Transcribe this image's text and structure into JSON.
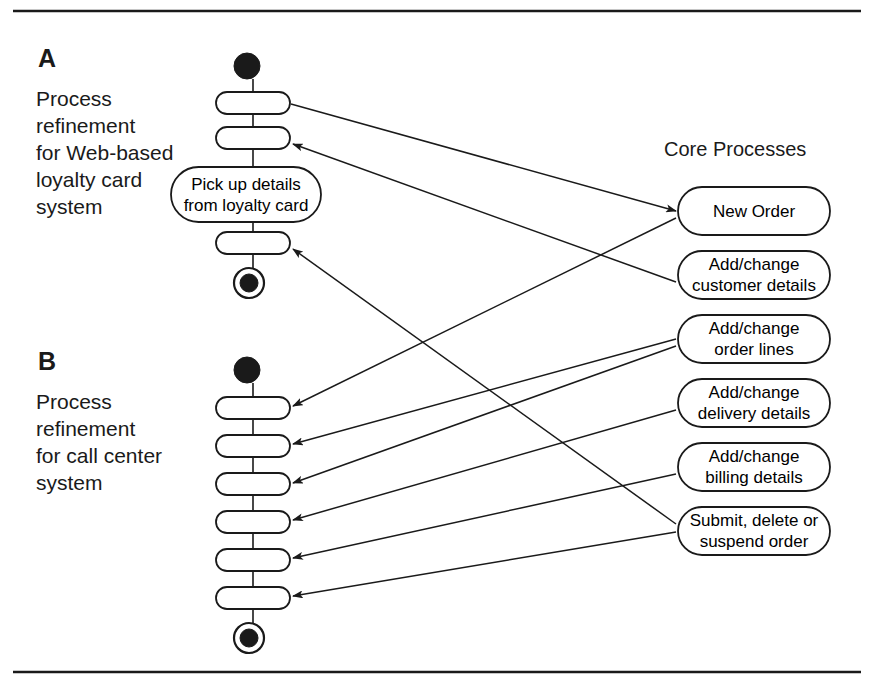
{
  "figure": {
    "top_rule": true,
    "bottom_rule": true,
    "line_color": "#1a1a1a",
    "fill_color": "#ffffff",
    "node_fill": "#ffffff",
    "marker_fill": "#1a1a1a"
  },
  "sections": [
    {
      "letter": "A",
      "description": "Process\nrefinement\nfor Web-based\nloyalty card\nsystem",
      "letter_x": 38,
      "letter_y": 44,
      "desc_x": 36,
      "desc_y": 85,
      "lane_x": 253,
      "start_node": {
        "cx": 247,
        "cy": 66,
        "r": 13
      },
      "end_node": {
        "cx": 249,
        "cy": 283,
        "r": 11,
        "ring_r": 15
      },
      "bars": [
        {
          "id": "a-bar-1",
          "x": 216,
          "y": 92,
          "w": 74,
          "h": 22
        },
        {
          "id": "a-bar-2",
          "x": 216,
          "y": 127,
          "w": 74,
          "h": 22
        },
        {
          "id": "a-bar-3",
          "x": 216,
          "y": 232,
          "w": 74,
          "h": 22
        }
      ],
      "activity": {
        "id": "pick-up-details",
        "label": "Pick up details\nfrom loyalty card",
        "x": 171,
        "y": 167,
        "w": 150,
        "h": 55
      }
    },
    {
      "letter": "B",
      "description": "Process\nrefinement\nfor call center\nsystem",
      "letter_x": 38,
      "letter_y": 347,
      "desc_x": 36,
      "desc_y": 388,
      "lane_x": 253,
      "start_node": {
        "cx": 247,
        "cy": 370,
        "r": 13
      },
      "end_node": {
        "cx": 249,
        "cy": 638,
        "r": 11,
        "ring_r": 15
      },
      "bars": [
        {
          "id": "b-bar-1",
          "x": 216,
          "y": 397,
          "w": 74,
          "h": 22
        },
        {
          "id": "b-bar-2",
          "x": 216,
          "y": 435,
          "w": 74,
          "h": 22
        },
        {
          "id": "b-bar-3",
          "x": 216,
          "y": 473,
          "w": 74,
          "h": 22
        },
        {
          "id": "b-bar-4",
          "x": 216,
          "y": 511,
          "w": 74,
          "h": 22
        },
        {
          "id": "b-bar-5",
          "x": 216,
          "y": 549,
          "w": 74,
          "h": 22
        },
        {
          "id": "b-bar-6",
          "x": 216,
          "y": 587,
          "w": 74,
          "h": 22
        }
      ]
    }
  ],
  "core_processes": {
    "header": "Core Processes",
    "header_x": 664,
    "header_y": 138,
    "box_x": 678,
    "box_w": 152,
    "box_h": 48,
    "items": [
      {
        "id": "new-order",
        "label": "New Order",
        "y": 187
      },
      {
        "id": "add-change-customer-details",
        "label": "Add/change\ncustomer details",
        "y": 251
      },
      {
        "id": "add-change-order-lines",
        "label": "Add/change\norder lines",
        "y": 315
      },
      {
        "id": "add-change-delivery-details",
        "label": "Add/change\ndelivery details",
        "y": 379
      },
      {
        "id": "add-change-billing-details",
        "label": "Add/change\nbilling details",
        "y": 443
      },
      {
        "id": "submit-delete-suspend-order",
        "label": "Submit, delete or\nsuspend order",
        "y": 507
      }
    ]
  },
  "connections": [
    {
      "id": "conn-a1-to-new-order",
      "from": "a-bar-1",
      "to": "new-order",
      "x1": 291,
      "y1": 104,
      "x2": 676,
      "y2": 211,
      "arrow_at": "end"
    },
    {
      "id": "conn-customer-details-to-a2",
      "from": "add-change-customer-details",
      "to": "a-bar-2",
      "x1": 676,
      "y1": 282,
      "x2": 293,
      "y2": 144,
      "arrow_at": "end"
    },
    {
      "id": "conn-submit-to-a3",
      "from": "submit-delete-suspend-order",
      "to": "a-bar-3",
      "x1": 676,
      "y1": 524,
      "x2": 293,
      "y2": 249,
      "arrow_at": "end"
    },
    {
      "id": "conn-new-order-to-b1",
      "from": "new-order",
      "to": "b-bar-1",
      "x1": 676,
      "y1": 218,
      "x2": 293,
      "y2": 406,
      "arrow_at": "end"
    },
    {
      "id": "conn-order-lines-to-b2",
      "from": "add-change-order-lines",
      "to": "b-bar-2",
      "x1": 676,
      "y1": 339,
      "x2": 293,
      "y2": 444,
      "arrow_at": "end"
    },
    {
      "id": "conn-order-lines-to-b3",
      "from": "add-change-order-lines",
      "to": "b-bar-3",
      "x1": 676,
      "y1": 346,
      "x2": 293,
      "y2": 483,
      "arrow_at": "end"
    },
    {
      "id": "conn-delivery-details-to-b4",
      "from": "add-change-delivery-details",
      "to": "b-bar-4",
      "x1": 676,
      "y1": 410,
      "x2": 293,
      "y2": 520,
      "arrow_at": "end"
    },
    {
      "id": "conn-billing-details-to-b5",
      "from": "add-change-billing-details",
      "to": "b-bar-5",
      "x1": 676,
      "y1": 474,
      "x2": 293,
      "y2": 558,
      "arrow_at": "end"
    },
    {
      "id": "conn-submit-to-b6",
      "from": "submit-delete-suspend-order",
      "to": "b-bar-6",
      "x1": 676,
      "y1": 532,
      "x2": 293,
      "y2": 596,
      "arrow_at": "end"
    }
  ],
  "rules": [
    {
      "id": "top-rule",
      "x1": 13,
      "y1": 11,
      "x2": 861,
      "y2": 11
    },
    {
      "id": "bottom-rule",
      "x1": 13,
      "y1": 672,
      "x2": 861,
      "y2": 672
    }
  ]
}
